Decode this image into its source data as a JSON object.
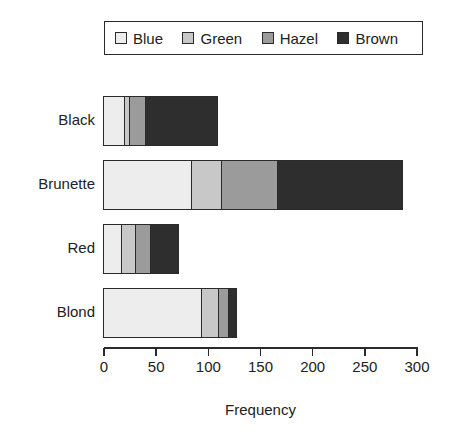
{
  "chart_data": {
    "type": "bar",
    "orientation": "horizontal",
    "stacked": true,
    "title": "",
    "xlabel": "Frequency",
    "ylabel": "",
    "xlim": [
      0,
      300
    ],
    "xticks": [
      0,
      50,
      100,
      150,
      200,
      250,
      300
    ],
    "grid": false,
    "legend_position": "top",
    "categories": [
      "Black",
      "Brunette",
      "Red",
      "Blond"
    ],
    "series": [
      {
        "name": "Blue",
        "color": "#EDEDED",
        "values": [
          20,
          84,
          17,
          94
        ]
      },
      {
        "name": "Green",
        "color": "#C8C8C8",
        "values": [
          5,
          29,
          14,
          16
        ]
      },
      {
        "name": "Hazel",
        "color": "#9B9B9B",
        "values": [
          15,
          54,
          14,
          10
        ]
      },
      {
        "name": "Brown",
        "color": "#2E2E2E",
        "values": [
          68,
          119,
          26,
          7
        ]
      }
    ],
    "category_totals": [
      108,
      286,
      71,
      127
    ]
  },
  "colors": {
    "ink": "#222222",
    "background": "#FFFFFF"
  }
}
